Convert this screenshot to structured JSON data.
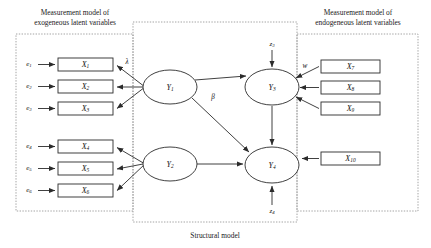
{
  "figure": {
    "type": "structural-equation-model-path-diagram",
    "width": 431,
    "height": 248,
    "background": "#ffffff",
    "line_color": "#2b2b2b",
    "dashed_region_color": "#8d8d8d"
  },
  "regions": [
    {
      "id": "exogenous-measurement",
      "title_line1": "Measurement model of",
      "title_line2": "exogeneous latent variables",
      "x": 16,
      "y": 34,
      "w": 117,
      "h": 177
    },
    {
      "id": "structural",
      "title_line1": "Structural model",
      "title_line2": "",
      "x": 133,
      "y": 22,
      "w": 164,
      "h": 200
    },
    {
      "id": "endogenous-measurement",
      "title_line1": "Measurement model of",
      "title_line2": "endogeneous latent variables",
      "x": 297,
      "y": 34,
      "w": 121,
      "h": 177
    }
  ],
  "titles": {
    "exogenous": {
      "line1": "Measurement model of",
      "line2": "exogeneous latent variables",
      "x": 75,
      "y": 17
    },
    "endogenous": {
      "line1": "Measurement model of",
      "line2": "endogeneous latent variables",
      "x": 358,
      "y": 17
    },
    "structural": {
      "line1": "Structural model",
      "x": 215,
      "y": 235
    }
  },
  "observed_variables": [
    {
      "id": "x1",
      "base": "X",
      "sub": "1",
      "x": 58,
      "y": 58,
      "w": 55,
      "h": 13
    },
    {
      "id": "x2",
      "base": "X",
      "sub": "2",
      "x": 58,
      "y": 80,
      "w": 55,
      "h": 13
    },
    {
      "id": "x3",
      "base": "X",
      "sub": "3",
      "x": 58,
      "y": 102,
      "w": 55,
      "h": 13
    },
    {
      "id": "x4",
      "base": "X",
      "sub": "4",
      "x": 58,
      "y": 140,
      "w": 55,
      "h": 13
    },
    {
      "id": "x5",
      "base": "X",
      "sub": "5",
      "x": 58,
      "y": 162,
      "w": 55,
      "h": 13
    },
    {
      "id": "x6",
      "base": "X",
      "sub": "6",
      "x": 58,
      "y": 184,
      "w": 55,
      "h": 13
    },
    {
      "id": "x7",
      "base": "X",
      "sub": "7",
      "x": 321,
      "y": 60,
      "w": 59,
      "h": 13
    },
    {
      "id": "x8",
      "base": "X",
      "sub": "8",
      "x": 321,
      "y": 81,
      "w": 59,
      "h": 13
    },
    {
      "id": "x9",
      "base": "X",
      "sub": "9",
      "x": 321,
      "y": 102,
      "w": 59,
      "h": 13
    },
    {
      "id": "x10",
      "base": "X",
      "sub": "10",
      "x": 321,
      "y": 152,
      "w": 59,
      "h": 13
    }
  ],
  "latent_variables": [
    {
      "id": "y1",
      "base": "Y",
      "sub": "1",
      "cx": 170,
      "cy": 87,
      "rx": 27,
      "ry": 17
    },
    {
      "id": "y2",
      "base": "Y",
      "sub": "2",
      "cx": 170,
      "cy": 164,
      "rx": 27,
      "ry": 17
    },
    {
      "id": "y3",
      "base": "Y",
      "sub": "3",
      "cx": 272,
      "cy": 87,
      "rx": 27,
      "ry": 18
    },
    {
      "id": "y4",
      "base": "Y",
      "sub": "4",
      "cx": 272,
      "cy": 165,
      "rx": 27,
      "ry": 18
    }
  ],
  "error_terms": [
    {
      "id": "e1",
      "base": "e",
      "sub": "1",
      "x": 29,
      "y": 64
    },
    {
      "id": "e2",
      "base": "e",
      "sub": "2",
      "x": 29,
      "y": 86
    },
    {
      "id": "e3",
      "base": "e",
      "sub": "3",
      "x": 29,
      "y": 108
    },
    {
      "id": "e4",
      "base": "e",
      "sub": "4",
      "x": 29,
      "y": 146
    },
    {
      "id": "e5",
      "base": "e",
      "sub": "5",
      "x": 29,
      "y": 168
    },
    {
      "id": "e6",
      "base": "e",
      "sub": "6",
      "x": 29,
      "y": 190
    },
    {
      "id": "z3",
      "base": "z",
      "sub": "3",
      "x": 272,
      "y": 44
    },
    {
      "id": "z4",
      "base": "z",
      "sub": "4",
      "x": 272,
      "y": 211
    }
  ],
  "path_coefficients": [
    {
      "id": "lambda",
      "symbol": "λ",
      "x": 127,
      "y": 62
    },
    {
      "id": "beta",
      "symbol": "β",
      "x": 213,
      "y": 97
    },
    {
      "id": "w",
      "symbol": "w",
      "x": 305,
      "y": 66
    }
  ],
  "edges": [
    {
      "id": "e1-to-x1",
      "from": "e1",
      "to": "x1",
      "kind": "straight"
    },
    {
      "id": "e2-to-x2",
      "from": "e2",
      "to": "x2",
      "kind": "straight"
    },
    {
      "id": "e3-to-x3",
      "from": "e3",
      "to": "x3",
      "kind": "straight"
    },
    {
      "id": "e4-to-x4",
      "from": "e4",
      "to": "x4",
      "kind": "straight"
    },
    {
      "id": "e5-to-x5",
      "from": "e5",
      "to": "x5",
      "kind": "straight"
    },
    {
      "id": "e6-to-x6",
      "from": "e6",
      "to": "x6",
      "kind": "straight"
    },
    {
      "id": "y1-to-x1",
      "from": "y1",
      "to": "x1",
      "kind": "loading"
    },
    {
      "id": "y1-to-x2",
      "from": "y1",
      "to": "x2",
      "kind": "loading"
    },
    {
      "id": "y1-to-x3",
      "from": "y1",
      "to": "x3",
      "kind": "loading"
    },
    {
      "id": "y2-to-x4",
      "from": "y2",
      "to": "x4",
      "kind": "loading"
    },
    {
      "id": "y2-to-x5",
      "from": "y2",
      "to": "x5",
      "kind": "loading"
    },
    {
      "id": "y2-to-x6",
      "from": "y2",
      "to": "x6",
      "kind": "loading"
    },
    {
      "id": "y1-to-y3",
      "from": "y1",
      "to": "y3",
      "kind": "structural"
    },
    {
      "id": "y1-to-y4",
      "from": "y1",
      "to": "y4",
      "kind": "structural"
    },
    {
      "id": "y2-to-y4",
      "from": "y2",
      "to": "y4",
      "kind": "structural"
    },
    {
      "id": "y3-to-y4",
      "from": "y3",
      "to": "y4",
      "kind": "structural"
    },
    {
      "id": "x7-to-y3",
      "from": "x7",
      "to": "y3",
      "kind": "loading"
    },
    {
      "id": "x8-to-y3",
      "from": "x8",
      "to": "y3",
      "kind": "loading"
    },
    {
      "id": "x9-to-y3",
      "from": "x9",
      "to": "y3",
      "kind": "loading"
    },
    {
      "id": "x10-to-y4",
      "from": "x10",
      "to": "y4",
      "kind": "loading"
    },
    {
      "id": "z3-to-y3",
      "from": "z3",
      "to": "y3",
      "kind": "disturbance"
    },
    {
      "id": "z4-to-y4",
      "from": "z4",
      "to": "y4",
      "kind": "disturbance"
    }
  ]
}
